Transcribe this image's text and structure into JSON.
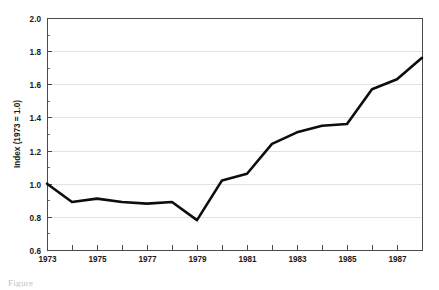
{
  "figure": {
    "caption_fragment": "Figure"
  },
  "chart_data": {
    "type": "line",
    "title": "",
    "subtitle": "",
    "xlabel": "",
    "ylabel": "Index (1973 = 1.0)",
    "xlim": [
      1973,
      1988
    ],
    "ylim": [
      0.6,
      2.0
    ],
    "grid": "horizontal",
    "legend": "none",
    "y_ticks": [
      "2.0",
      "1.8",
      "1.6",
      "1.4",
      "1.2",
      "1.0",
      "0.8",
      "0.6"
    ],
    "y_tick_values": [
      2.0,
      1.8,
      1.6,
      1.4,
      1.2,
      1.0,
      0.8,
      0.6
    ],
    "y_minor_step": 0.1,
    "x_ticks": [
      1973,
      1974,
      1975,
      1976,
      1977,
      1978,
      1979,
      1980,
      1981,
      1982,
      1983,
      1984,
      1985,
      1986,
      1987,
      1988
    ],
    "x_tick_labels": [
      "1973",
      "",
      "1975",
      "",
      "1977",
      "",
      "1979",
      "",
      "1981",
      "",
      "1983",
      "",
      "1985",
      "",
      "1987",
      ""
    ],
    "series": [
      {
        "name": "Index (1973 = 1.0)",
        "color": "#0d0d0d",
        "x": [
          1973,
          1974,
          1975,
          1976,
          1977,
          1978,
          1979,
          1980,
          1981,
          1982,
          1983,
          1984,
          1985,
          1986,
          1987,
          1988
        ],
        "values": [
          1.0,
          0.89,
          0.91,
          0.89,
          0.88,
          0.89,
          0.78,
          1.02,
          1.06,
          1.24,
          1.31,
          1.35,
          1.36,
          1.57,
          1.63,
          1.76
        ]
      }
    ]
  }
}
